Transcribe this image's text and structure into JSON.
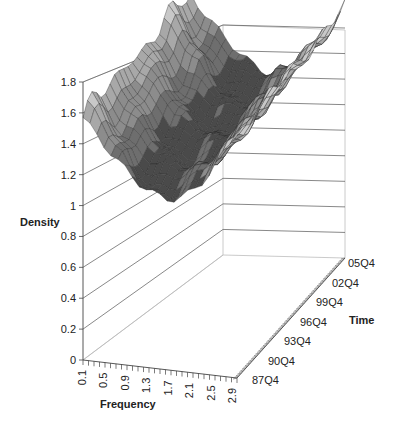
{
  "chart_data": {
    "type": "surface3d",
    "title": "",
    "zlabel": "Density",
    "xlabel": "Frequency",
    "ylabel": "Time",
    "zlim": [
      0,
      1.8
    ],
    "z_ticks": [
      "0",
      "0.2",
      "0.4",
      "0.6",
      "0.8",
      "1",
      "1.2",
      "1.4",
      "1.6",
      "1.8"
    ],
    "x_ticks": [
      "0.1",
      "0.5",
      "0.9",
      "1.3",
      "1.7",
      "2.1",
      "2.5",
      "2.9"
    ],
    "y_ticks": [
      "87Q4",
      "90Q4",
      "93Q4",
      "96Q4",
      "99Q4",
      "02Q4",
      "05Q4"
    ],
    "grid": true,
    "legend": "none",
    "colors": {
      "surface_light": "#c8c8c8",
      "surface_mid": "#8c8c8c",
      "surface_dark": "#4a4a4a",
      "gridline": "#555555",
      "wall": "#bdbdbd"
    },
    "series_approx": [
      {
        "name": "87Q4",
        "x": [
          0.1,
          0.5,
          0.9,
          1.3,
          1.7,
          2.1,
          2.5,
          2.9
        ],
        "values": [
          1.6,
          1.55,
          1.4,
          1.2,
          1.1,
          1.15,
          1.35,
          1.55
        ]
      },
      {
        "name": "96Q4",
        "x": [
          0.1,
          0.5,
          0.9,
          1.3,
          1.7,
          2.1,
          2.5,
          2.9
        ],
        "values": [
          1.62,
          1.58,
          1.42,
          1.22,
          1.12,
          1.18,
          1.4,
          1.6
        ]
      },
      {
        "name": "05Q4",
        "x": [
          0.1,
          0.5,
          0.9,
          1.3,
          1.7,
          2.1,
          2.5,
          2.9
        ],
        "values": [
          1.65,
          1.6,
          1.45,
          1.25,
          1.15,
          1.2,
          1.45,
          1.7
        ]
      }
    ]
  }
}
